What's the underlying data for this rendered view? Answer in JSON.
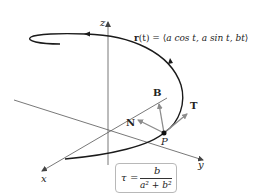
{
  "diagram": {
    "curve_equation": "r(t) = ⟨a cos t, a sin t, bt⟩",
    "curve_equation_parts": {
      "lhs": "r",
      "arg": "(t) = ⟨",
      "body": "a cos t, a sin t, bt",
      "close": "⟩"
    },
    "axes": {
      "x": "x",
      "y": "y",
      "z": "z"
    },
    "vectors": {
      "tangent": "T",
      "normal": "N",
      "binormal": "B"
    },
    "point": "P",
    "torsion_formula": {
      "symbol": "τ",
      "equals": "=",
      "numerator": "b",
      "denominator": "a² + b²"
    },
    "colors": {
      "curve": "#1a1a1a",
      "axes": "#555555",
      "vectors": "#8c8c8c",
      "box_border": "#b8b8b8"
    }
  }
}
